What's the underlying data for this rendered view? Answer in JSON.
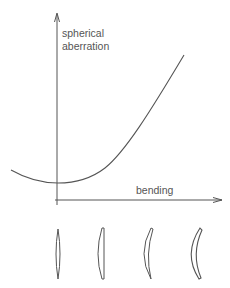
{
  "figure": {
    "y_axis_label_line1": "spherical",
    "y_axis_label_line2": "aberration",
    "x_axis_label": "bending",
    "curve_description": "spherical aberration vs lens bending (parabola with minimum near zero bending)",
    "lenses": [
      {
        "name": "biconvex lens",
        "shape": "equiconvex"
      },
      {
        "name": "plano-convex lens",
        "shape": "plano-convex"
      },
      {
        "name": "meniscus lens",
        "shape": "positive meniscus"
      },
      {
        "name": "strong meniscus lens",
        "shape": "strong positive meniscus"
      }
    ],
    "colors": {
      "line": "#555555",
      "background": "#ffffff"
    }
  }
}
